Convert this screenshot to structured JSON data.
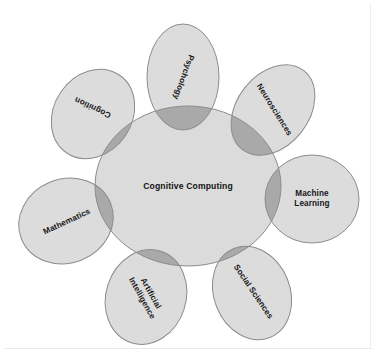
{
  "diagram": {
    "title_center": "Cognitive Computing",
    "type": "venn-petal-diagram",
    "colors": {
      "petal_fill": "#dcdcdc",
      "center_fill": "#dbdbdb",
      "overlap_fill": "#a9a9a9",
      "stroke": "#8c8c8c",
      "text": "#171717",
      "background": "#ffffff",
      "frame_border": "#e9e9e9"
    },
    "center": {
      "label": "Cognitive Computing",
      "cx": 188,
      "cy": 186,
      "rx": 93,
      "ry": 80,
      "label_x": 188,
      "label_y": 186
    },
    "petals": [
      {
        "id": "psychology",
        "label": "Psychology",
        "cx": 183,
        "cy": 77,
        "rx": 36,
        "ry": 53,
        "petal_rotate": 0,
        "label_x": 183,
        "label_y": 77,
        "label_rotate": 110
      },
      {
        "id": "neurosciences",
        "label": "Neurosciences",
        "cx": 273,
        "cy": 110,
        "rx": 36,
        "ry": 50,
        "petal_rotate": 38,
        "label_x": 274,
        "label_y": 110,
        "label_rotate": 58
      },
      {
        "id": "machine-learning",
        "label": "Machine\nLearning",
        "cx": 312,
        "cy": 199,
        "rx": 47,
        "ry": 44,
        "petal_rotate": 0,
        "label_x": 312,
        "label_y": 199,
        "label_rotate": 0
      },
      {
        "id": "social-sciences",
        "label": "Social Sciences",
        "cx": 252,
        "cy": 293,
        "rx": 38,
        "ry": 48,
        "petal_rotate": -22,
        "label_x": 253,
        "label_y": 292,
        "label_rotate": 56
      },
      {
        "id": "artificial-intelligence",
        "label": "Artificial\nIntelligence",
        "cx": 146,
        "cy": 297,
        "rx": 40,
        "ry": 48,
        "petal_rotate": 18,
        "label_x": 146,
        "label_y": 296,
        "label_rotate": 61
      },
      {
        "id": "mathematics",
        "label": "Mathematics",
        "cx": 66,
        "cy": 221,
        "rx": 48,
        "ry": 42,
        "petal_rotate": -22,
        "label_x": 67,
        "label_y": 222,
        "label_rotate": -25
      },
      {
        "id": "cognition",
        "label": "Cognition",
        "cx": 93,
        "cy": 114,
        "rx": 39,
        "ry": 47,
        "petal_rotate": 34,
        "label_x": 93,
        "label_y": 107,
        "label_rotate": 205
      }
    ]
  }
}
